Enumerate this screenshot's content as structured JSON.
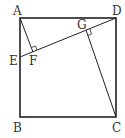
{
  "diagram": {
    "type": "geometry",
    "points": {
      "A": {
        "label": "A",
        "x": 20,
        "y": 18
      },
      "D": {
        "label": "D",
        "x": 116,
        "y": 18
      },
      "B": {
        "label": "B",
        "x": 20,
        "y": 117
      },
      "C": {
        "label": "C",
        "x": 116,
        "y": 117
      },
      "E": {
        "label": "E",
        "x": 20,
        "y": 57
      },
      "F": {
        "label": "F",
        "x": 33,
        "y": 52
      },
      "G": {
        "label": "G",
        "x": 86,
        "y": 31
      }
    },
    "segments": [
      "AB",
      "BC",
      "CD",
      "DA",
      "ED",
      "AF",
      "CG"
    ],
    "right_angles": [
      "F",
      "G"
    ],
    "stroke_color": "#222222"
  }
}
